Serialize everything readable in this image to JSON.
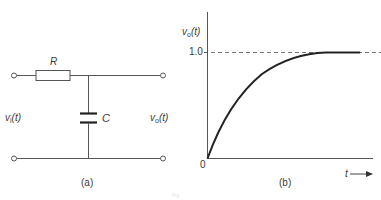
{
  "figure": {
    "panel_a": {
      "label": "(a)",
      "resistor_label": "R",
      "capacitor_label": "C",
      "input_label": {
        "v": "v",
        "sub": "i",
        "arg": "(t)"
      },
      "output_label": {
        "v": "v",
        "sub": "o",
        "arg": "(t)"
      }
    },
    "panel_b": {
      "label": "(b)",
      "y_axis_label": {
        "v": "v",
        "sub": "o",
        "arg": "(t)"
      },
      "y_tick_1": "1.0",
      "origin_label": "0",
      "x_axis_label": "t",
      "x_arrow": "→"
    },
    "caption": "Fig."
  },
  "colors": {
    "line": "#555555",
    "curve": "#222222",
    "dashed": "#777777"
  }
}
